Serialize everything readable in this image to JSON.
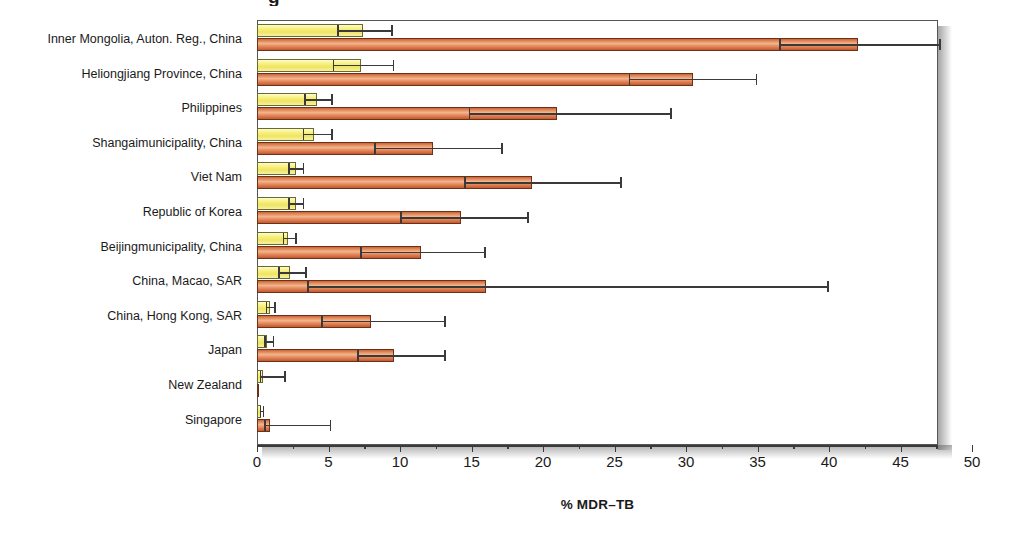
{
  "figure": {
    "title_partial": "g",
    "axis_title": "% MDR–TB"
  },
  "chart_data": {
    "type": "bar",
    "orientation": "horizontal",
    "title": "",
    "xlabel": "% MDR–TB",
    "ylabel": "",
    "xlim": [
      0,
      50
    ],
    "xticks": [
      0,
      5,
      10,
      15,
      20,
      25,
      30,
      35,
      40,
      45,
      50
    ],
    "xtick_labels": [
      "0",
      "5",
      "10",
      "15",
      "20",
      "25",
      "30",
      "35",
      "40",
      "45",
      "50"
    ],
    "grid": false,
    "legend": [],
    "categories": [
      "Inner Mongolia, Auton. Reg., China",
      "Heliongjiang Province, China",
      "Philippines",
      "Shangaimunicipality, China",
      "Viet Nam",
      "Republic of Korea",
      "Beijingmunicipality, China",
      "China, Macao, SAR",
      "China, Hong Kong, SAR",
      "Japan",
      "New Zealand",
      "Singapore"
    ],
    "series": [
      {
        "name": "new-cases",
        "color": "#efe463",
        "values": [
          7.4,
          7.3,
          4.2,
          4.0,
          2.7,
          2.7,
          2.2,
          2.3,
          0.9,
          0.7,
          0.4,
          0.3
        ],
        "ci_lower": [
          5.6,
          5.3,
          3.3,
          3.2,
          2.2,
          2.2,
          1.8,
          1.5,
          0.6,
          0.5,
          0.2,
          0.2
        ],
        "ci_upper": [
          9.5,
          9.6,
          5.3,
          5.3,
          3.3,
          3.3,
          2.8,
          3.5,
          1.3,
          1.2,
          2.0,
          0.5
        ]
      },
      {
        "name": "previously-treated-cases",
        "color": "#e08a5a",
        "values": [
          42.0,
          30.5,
          21.0,
          12.3,
          19.2,
          14.3,
          11.5,
          16.0,
          8.0,
          9.6,
          0.0,
          0.9
        ],
        "ci_lower": [
          36.5,
          26.0,
          14.8,
          8.2,
          14.5,
          10.0,
          7.2,
          3.5,
          4.5,
          7.0,
          0.0,
          0.5
        ],
        "ci_upper": [
          47.8,
          35.0,
          29.0,
          17.2,
          25.5,
          19.0,
          16.0,
          40.0,
          13.2,
          13.2,
          0.0,
          5.2
        ]
      }
    ]
  }
}
